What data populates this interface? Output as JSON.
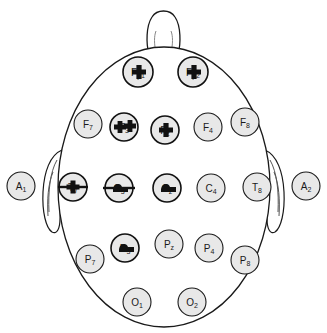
{
  "diagram": {
    "view": "top-down head map, nose at top",
    "colors": {
      "electrode_fill": "#e8e8e8",
      "outline": "#1a1a1a",
      "marker": "#111111",
      "background": "#ffffff"
    },
    "anatomy": {
      "nose_name": "nose",
      "left_ear_name": "left-ear",
      "right_ear_name": "right-ear",
      "head_name": "head-outline"
    }
  },
  "electrodes": [
    {
      "id": "Fp1",
      "base": "F",
      "sub": "p1",
      "x": 138,
      "y": 72,
      "r": 15,
      "marked": true,
      "marker": "plus"
    },
    {
      "id": "Fp2",
      "base": "F",
      "sub": "p2",
      "x": 193,
      "y": 72,
      "r": 15,
      "marked": true,
      "marker": "plus"
    },
    {
      "id": "F7",
      "base": "F",
      "sub": "7",
      "x": 88,
      "y": 124,
      "r": 14,
      "marked": false,
      "marker": "none"
    },
    {
      "id": "F3",
      "base": "F",
      "sub": "3",
      "x": 124,
      "y": 127,
      "r": 14,
      "marked": true,
      "marker": "double-plus"
    },
    {
      "id": "Fz",
      "base": "F",
      "sub": "z",
      "x": 165,
      "y": 130,
      "r": 14,
      "marked": true,
      "marker": "plus"
    },
    {
      "id": "F4",
      "base": "F",
      "sub": "4",
      "x": 208,
      "y": 127,
      "r": 14,
      "marked": false,
      "marker": "none"
    },
    {
      "id": "F8",
      "base": "F",
      "sub": "8",
      "x": 245,
      "y": 122,
      "r": 14,
      "marked": false,
      "marker": "none"
    },
    {
      "id": "A1",
      "base": "A",
      "sub": "1",
      "x": 21,
      "y": 186,
      "r": 14,
      "marked": false,
      "marker": "none"
    },
    {
      "id": "T7",
      "base": "T",
      "sub": "7",
      "x": 73,
      "y": 187,
      "r": 14,
      "marked": true,
      "marker": "bar-plus"
    },
    {
      "id": "C3",
      "base": "C",
      "sub": "3",
      "x": 119,
      "y": 188,
      "r": 14,
      "marked": true,
      "marker": "bar-blob"
    },
    {
      "id": "Cz",
      "base": "C",
      "sub": "z",
      "x": 167,
      "y": 188,
      "r": 14,
      "marked": true,
      "marker": "blob"
    },
    {
      "id": "C4",
      "base": "C",
      "sub": "4",
      "x": 211,
      "y": 188,
      "r": 14,
      "marked": false,
      "marker": "none"
    },
    {
      "id": "T8",
      "base": "T",
      "sub": "8",
      "x": 257,
      "y": 187,
      "r": 14,
      "marked": false,
      "marker": "none"
    },
    {
      "id": "A2",
      "base": "A",
      "sub": "2",
      "x": 306,
      "y": 186,
      "r": 14,
      "marked": false,
      "marker": "none"
    },
    {
      "id": "P7",
      "base": "P",
      "sub": "7",
      "x": 90,
      "y": 259,
      "r": 14,
      "marked": false,
      "marker": "none"
    },
    {
      "id": "P3",
      "base": "P",
      "sub": "3",
      "x": 125,
      "y": 248,
      "r": 14,
      "marked": true,
      "marker": "blob"
    },
    {
      "id": "Pz",
      "base": "P",
      "sub": "z",
      "x": 169,
      "y": 244,
      "r": 14,
      "marked": false,
      "marker": "none"
    },
    {
      "id": "P4",
      "base": "P",
      "sub": "4",
      "x": 209,
      "y": 248,
      "r": 14,
      "marked": false,
      "marker": "none"
    },
    {
      "id": "P8",
      "base": "P",
      "sub": "8",
      "x": 245,
      "y": 260,
      "r": 14,
      "marked": false,
      "marker": "none"
    },
    {
      "id": "O1",
      "base": "O",
      "sub": "1",
      "x": 137,
      "y": 302,
      "r": 14,
      "marked": false,
      "marker": "none"
    },
    {
      "id": "O2",
      "base": "O",
      "sub": "2",
      "x": 192,
      "y": 302,
      "r": 14,
      "marked": false,
      "marker": "none"
    }
  ]
}
